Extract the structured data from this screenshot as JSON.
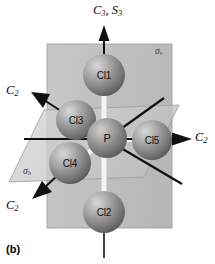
{
  "figure": {
    "caption": "(b)",
    "molecule": "PCl5",
    "background": "#ffffff"
  },
  "colors": {
    "atom_light": "#c9c9c9",
    "atom_mid": "#8e8e8e",
    "atom_dark": "#5a5a5a",
    "plane_vertical": "#b9b9b9",
    "plane_horizontal": "#cfcfcf",
    "axis_line": "#101010",
    "bond": "#f2f2f2",
    "label_text": "#0a0a0a"
  },
  "atoms": [
    {
      "id": "cl1",
      "label": "Cl1",
      "x": 104,
      "y": 75,
      "r": 21
    },
    {
      "id": "cl3",
      "label": "Cl3",
      "x": 76,
      "y": 120,
      "r": 20
    },
    {
      "id": "p",
      "label": "P",
      "x": 107,
      "y": 138,
      "r": 20
    },
    {
      "id": "cl5",
      "label": "Cl5",
      "x": 152,
      "y": 140,
      "r": 20
    },
    {
      "id": "cl4",
      "label": "Cl4",
      "x": 70,
      "y": 163,
      "r": 21
    },
    {
      "id": "cl2",
      "label": "Cl2",
      "x": 104,
      "y": 212,
      "r": 21
    }
  ],
  "axes": [
    {
      "id": "c3-s3",
      "label": "C",
      "sub": "3, S",
      "sub2": "3",
      "text": "C3, S3",
      "position": "top"
    },
    {
      "id": "c2-upper-left",
      "label": "C",
      "sub": "2",
      "text": "C2",
      "position": "upper-left"
    },
    {
      "id": "c2-lower-left",
      "label": "C",
      "sub": "2",
      "text": "C2",
      "position": "lower-left"
    },
    {
      "id": "c2-right",
      "label": "C",
      "sub": "2",
      "text": "C2",
      "position": "right"
    }
  ],
  "planes": [
    {
      "id": "sigma-v",
      "label": "σ",
      "sub": "v",
      "text": "σv",
      "position": "top-right",
      "orientation": "vertical"
    },
    {
      "id": "sigma-h",
      "label": "σ",
      "sub": "h",
      "text": "σh",
      "position": "left",
      "orientation": "horizontal"
    }
  ],
  "labels": {
    "c3s3_main": "C",
    "c3s3_sub1": "3",
    "c3s3_mid": ", S",
    "c3s3_sub2": "3",
    "c2_main": "C",
    "c2_sub": "2",
    "sigma_v_main": "σ",
    "sigma_v_sub": "v",
    "sigma_h_main": "σ",
    "sigma_h_sub": "h",
    "atom_cl1": "Cl1",
    "atom_cl2": "Cl2",
    "atom_cl3": "Cl3",
    "atom_cl4": "Cl4",
    "atom_cl5": "Cl5",
    "atom_p": "P",
    "caption": "(b)"
  }
}
